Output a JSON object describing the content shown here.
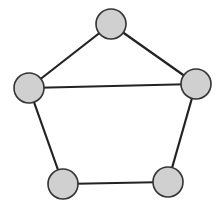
{
  "diagram": {
    "type": "graph",
    "colors": {
      "background": "#ffffff",
      "node_fill": "#d0d0d0",
      "node_stroke": "#333333",
      "edge": "#222222"
    },
    "node_radius": 15,
    "nodes": [
      {
        "id": "top",
        "x": 111,
        "y": 24
      },
      {
        "id": "left",
        "x": 29,
        "y": 88
      },
      {
        "id": "right",
        "x": 196,
        "y": 84
      },
      {
        "id": "bottom-left",
        "x": 63,
        "y": 184
      },
      {
        "id": "bottom-right",
        "x": 168,
        "y": 182
      }
    ],
    "edges": [
      {
        "from": "top",
        "to": "left"
      },
      {
        "from": "top",
        "to": "right"
      },
      {
        "from": "left",
        "to": "right"
      },
      {
        "from": "left",
        "to": "bottom-left"
      },
      {
        "from": "right",
        "to": "bottom-right"
      },
      {
        "from": "bottom-left",
        "to": "bottom-right"
      }
    ]
  }
}
